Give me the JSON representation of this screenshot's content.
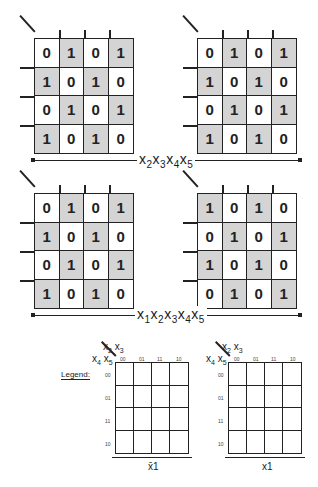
{
  "maps": [
    {
      "id": "top-left",
      "cells": [
        "0",
        "1",
        "0",
        "1",
        "1",
        "0",
        "1",
        "0",
        "0",
        "1",
        "0",
        "1",
        "1",
        "0",
        "1",
        "0"
      ],
      "shade": [
        0,
        1,
        0,
        1,
        1,
        0,
        1,
        0,
        0,
        1,
        0,
        1,
        1,
        0,
        1,
        0
      ]
    },
    {
      "id": "top-right",
      "cells": [
        "0",
        "1",
        "0",
        "1",
        "1",
        "0",
        "1",
        "0",
        "0",
        "1",
        "0",
        "1",
        "1",
        "0",
        "1",
        "0"
      ],
      "shade": [
        0,
        1,
        0,
        1,
        1,
        0,
        1,
        0,
        0,
        1,
        0,
        1,
        1,
        0,
        1,
        0
      ]
    },
    {
      "id": "bottom-left",
      "cells": [
        "0",
        "1",
        "0",
        "1",
        "1",
        "0",
        "1",
        "0",
        "0",
        "1",
        "0",
        "1",
        "1",
        "0",
        "1",
        "0"
      ],
      "shade": [
        0,
        1,
        0,
        1,
        1,
        0,
        1,
        0,
        0,
        1,
        0,
        1,
        1,
        0,
        1,
        0
      ]
    },
    {
      "id": "bottom-right",
      "cells": [
        "1",
        "0",
        "1",
        "0",
        "0",
        "1",
        "0",
        "1",
        "1",
        "0",
        "1",
        "0",
        "0",
        "1",
        "0",
        "1"
      ],
      "shade": [
        1,
        0,
        1,
        0,
        0,
        1,
        0,
        1,
        1,
        0,
        1,
        0,
        0,
        1,
        0,
        1
      ]
    }
  ],
  "labels": {
    "top_span": "x2x3x4x5",
    "bottom_span": "x1x2x3x4x5"
  },
  "legend": {
    "title": "Legend:",
    "col_var": "x2 x3",
    "row_var": "x4 x5",
    "col_headers": [
      "00",
      "01",
      "11",
      "10"
    ],
    "row_headers": [
      "00",
      "01",
      "11",
      "10"
    ],
    "left_brace": "x̄1",
    "right_brace": "x1"
  }
}
